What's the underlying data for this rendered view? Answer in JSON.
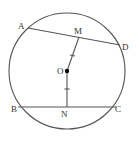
{
  "diagram": {
    "type": "geometry",
    "circle": {
      "center": "O",
      "cx": 67,
      "cy": 71,
      "r": 58
    },
    "points": {
      "A": {
        "label": "A",
        "x": 28,
        "y": 28
      },
      "D": {
        "label": "D",
        "x": 120,
        "y": 45
      },
      "M": {
        "label": "M",
        "x": 79,
        "y": 37
      },
      "O": {
        "label": "O",
        "x": 67,
        "y": 71
      },
      "B": {
        "label": "B",
        "x": 18,
        "y": 107
      },
      "C": {
        "label": "C",
        "x": 116,
        "y": 107
      },
      "N": {
        "label": "N",
        "x": 67,
        "y": 107
      }
    },
    "segments": [
      "AD",
      "BC",
      "OM",
      "ON"
    ],
    "equal_marks": [
      "OM",
      "ON"
    ],
    "colors": {
      "stroke": "#555555",
      "center_dot": "#000000"
    }
  }
}
